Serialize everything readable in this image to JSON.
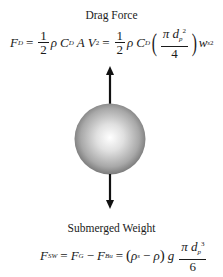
{
  "drag": {
    "title": "Drag Force",
    "F": "F",
    "F_sub": "D",
    "eq1": "=",
    "half_num": "1",
    "half_den": "2",
    "rho": "ρ",
    "C": "C",
    "C_sub": "D",
    "A": "A",
    "V": "V",
    "V_sup": "2",
    "eq2": "=",
    "half2_num": "1",
    "half2_den": "2",
    "rho2": "ρ",
    "C2": "C",
    "C2_sub": "D",
    "lparen": "(",
    "pi": "π",
    "d": "d",
    "d_sub": "p",
    "d_sup": "2",
    "den": "4",
    "rparen": ")",
    "w": "w",
    "w_sub": "s",
    "w_sup": "2"
  },
  "weight": {
    "title": "Submerged Weight",
    "F": "F",
    "F_sub": "SW",
    "eq1": "=",
    "FG": "F",
    "FG_sub": "G",
    "minus": "−",
    "FB": "F",
    "FB_sub": "Bu",
    "eq2": "=",
    "lparen": "(",
    "rho_s": "ρ",
    "rho_s_sub": "s",
    "minus2": "−",
    "rho": "ρ",
    "rparen": ")",
    "g": "g",
    "pi": "π",
    "d": "d",
    "d_sub": "p",
    "d_sup": "3",
    "den": "6"
  },
  "figure": {
    "sphere_light": "#ffffff",
    "sphere_dark": "#7a7a7a",
    "arrow_color": "#111111"
  }
}
